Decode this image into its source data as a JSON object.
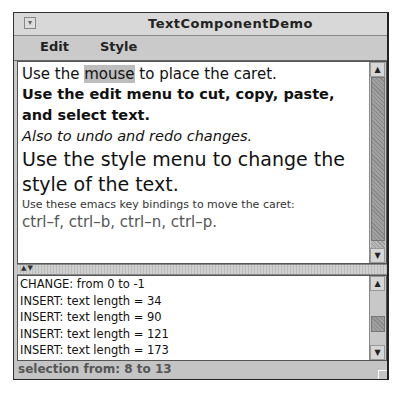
{
  "window": {
    "title": "TextComponentDemo"
  },
  "menubar": {
    "items": [
      {
        "label": "Edit"
      },
      {
        "label": "Style"
      }
    ]
  },
  "text_pane": {
    "line1_pre": "Use the ",
    "line1_selected": "mouse",
    "line1_post": " to place the caret.",
    "line2": "Use the edit menu to cut, copy, paste,",
    "line3": "and select text.",
    "line4": "Also to undo and redo changes.",
    "line5": "Use the style menu to change the",
    "line6": "style of the text.",
    "line7": "Use these emacs key bindings to move the caret:",
    "line8": "ctrl–f, ctrl–b, ctrl–n, ctrl–p."
  },
  "log_pane": {
    "lines": [
      "CHANGE: from 0 to -1",
      "INSERT: text length = 34",
      "INSERT: text length = 90",
      "INSERT: text length = 121",
      "INSERT: text length = 173"
    ]
  },
  "status": {
    "text": "selection from: 8 to 13"
  },
  "icons": {
    "close": "▾",
    "up": "▲",
    "down": "▼"
  }
}
